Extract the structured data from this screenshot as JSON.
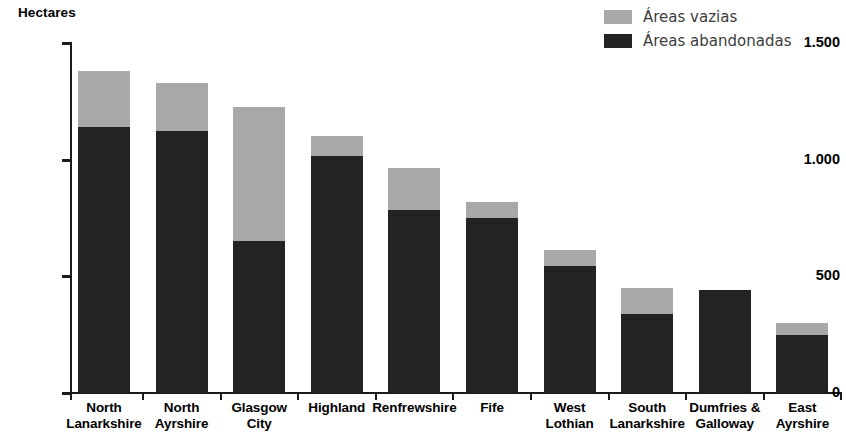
{
  "axis_title": "Hectares",
  "colors": {
    "vazias": "#a8a8a8",
    "abandonadas": "#232323",
    "axis": "#1a1a1a",
    "text": "#000000",
    "legend_text": "#3d3d3d"
  },
  "legend": {
    "position": "top-right",
    "items": [
      {
        "label": "Áreas vazias",
        "color": "#a8a8a8",
        "key": "vazias"
      },
      {
        "label": "Áreas abandonadas",
        "color": "#232323",
        "key": "abandonadas"
      }
    ]
  },
  "y_axis": {
    "label": "Hectares",
    "ticks": [
      "0",
      "500",
      "1.000",
      "1.500"
    ],
    "tick_values": [
      0,
      500,
      1000,
      1500
    ],
    "min": 0,
    "max": 1500
  },
  "chart_data": {
    "type": "bar",
    "subtype": "stacked-vertical",
    "title": "",
    "subtitle": "",
    "xlabel": "",
    "ylabel": "Hectares",
    "ylim": [
      0,
      1500
    ],
    "yticks": [
      0,
      500,
      1000,
      1500
    ],
    "ytick_labels": [
      "0",
      "500",
      "1.000",
      "1.500"
    ],
    "grid": false,
    "legend_position": "top-right",
    "categories": [
      "North Lanarkshire",
      "North Ayrshire",
      "Glasgow City",
      "Highland",
      "Renfrewshire",
      "Fife",
      "West Lothian",
      "South Lanarkshire",
      "Dumfries & Galloway",
      "East Ayrshire"
    ],
    "category_lines": [
      [
        "North",
        "Lanarkshire"
      ],
      [
        "North",
        "Ayrshire"
      ],
      [
        "Glasgow",
        "City"
      ],
      [
        "Highland",
        ""
      ],
      [
        "Renfrewshire",
        ""
      ],
      [
        "Fife",
        ""
      ],
      [
        "West",
        "Lothian"
      ],
      [
        "South",
        "Lanarkshire"
      ],
      [
        "Dumfries &",
        "Galloway"
      ],
      [
        "East",
        "Ayrshire"
      ]
    ],
    "series": [
      {
        "name": "Áreas abandonadas",
        "color": "#232323",
        "values": [
          1140,
          1125,
          650,
          1015,
          785,
          750,
          545,
          340,
          440,
          250
        ]
      },
      {
        "name": "Áreas vazias",
        "color": "#a8a8a8",
        "values": [
          240,
          205,
          575,
          85,
          180,
          70,
          70,
          110,
          0,
          50
        ]
      }
    ],
    "totals": [
      1380,
      1330,
      1225,
      1100,
      965,
      820,
      615,
      450,
      440,
      300
    ]
  }
}
